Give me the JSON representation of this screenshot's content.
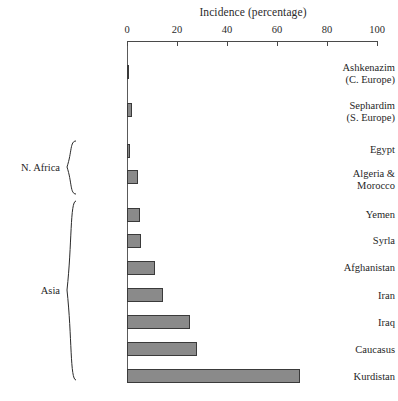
{
  "chart_data": {
    "type": "bar",
    "orientation": "horizontal",
    "title": "Incidence (percentage)",
    "xlabel": "Incidence (percentage)",
    "ylabel": "",
    "xlim": [
      0,
      100
    ],
    "xticks": [
      0,
      20,
      40,
      60,
      80,
      100
    ],
    "xtick_labels": [
      "0",
      "20",
      "40",
      "60",
      "80",
      "100"
    ],
    "grid": false,
    "legend": false,
    "axis_position": "top",
    "bar_fill_color": "#8a8a8a",
    "bar_border_color": "#3a3a3a",
    "categories": [
      "Ashkenazim (C. Europe)",
      "Sephardim (S. Europe)",
      "Egypt",
      "Algeria & Morocco",
      "Yemen",
      "Syria",
      "Afghanistan",
      "Iran",
      "Iraq",
      "Caucasus",
      "Kurdistan"
    ],
    "values": [
      0.8,
      1.8,
      1.0,
      4.5,
      5.0,
      5.5,
      11.0,
      14.5,
      25.0,
      28.0,
      69.0
    ],
    "groups": [
      {
        "name": "N. Africa",
        "members": [
          "Egypt",
          "Algeria & Morocco"
        ]
      },
      {
        "name": "Asia",
        "members": [
          "Yemen",
          "Syria",
          "Afghanistan",
          "Iran",
          "Iraq",
          "Caucasus",
          "Kurdistan"
        ]
      }
    ]
  },
  "labels": {
    "ashkenazim_line1": "Ashkenazim",
    "ashkenazim_line2": "(C. Europe)",
    "sephardim_line1": "Sephardim",
    "sephardim_line2": "(S. Europe)",
    "egypt": "Egypt",
    "algeria_line1": "Algeria &",
    "algeria_line2": "Morocco",
    "yemen": "Yemen",
    "syria": "Syrla",
    "afghanistan": "Afghanistan",
    "iran": "Iran",
    "iraq": "Iraq",
    "caucasus": "Caucasus",
    "kurdistan": "Kurdistan",
    "group_n_africa": "N. Africa",
    "group_asia": "Asia"
  },
  "ticks": {
    "t0": "0",
    "t20": "20",
    "t40": "40",
    "t60": "60",
    "t80": "80",
    "t100": "100"
  }
}
